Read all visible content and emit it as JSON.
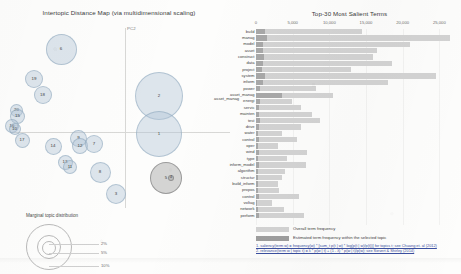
{
  "left_panel": {
    "title": "Intertopic Distance Map (via multidimensional scaling)",
    "axis_labels": {
      "x": "PC1",
      "y": "PC2"
    },
    "legend": {
      "title": "Marginal topic distribution",
      "ticks": [
        "2%",
        "5%",
        "10%"
      ]
    },
    "selected_term_callout": "asset_manag",
    "topics": [
      {
        "id": "6",
        "x": 53.0,
        "y": 23.0,
        "r": 15.5,
        "selected": false
      },
      {
        "id": "19",
        "x": 26.0,
        "y": 53.0,
        "r": 9.0,
        "selected": false
      },
      {
        "id": "18",
        "x": 34.5,
        "y": 69.0,
        "r": 9.0,
        "selected": false
      },
      {
        "id": "20",
        "x": 8.5,
        "y": 84.0,
        "r": 6.5,
        "selected": false
      },
      {
        "id": "15",
        "x": 9.5,
        "y": 90.0,
        "r": 7.5,
        "selected": false
      },
      {
        "id": "16",
        "x": 4.0,
        "y": 100.0,
        "r": 7.0,
        "selected": false
      },
      {
        "id": "10",
        "x": 6.5,
        "y": 103.0,
        "r": 6.0,
        "selected": false
      },
      {
        "id": "17",
        "x": 14.0,
        "y": 114.0,
        "r": 7.5,
        "selected": false
      },
      {
        "id": "14",
        "x": 45.0,
        "y": 120.0,
        "r": 8.5,
        "selected": false
      },
      {
        "id": "13",
        "x": 57.0,
        "y": 136.0,
        "r": 7.5,
        "selected": false
      },
      {
        "id": "11",
        "x": 62.0,
        "y": 141.0,
        "r": 7.0,
        "selected": false
      },
      {
        "id": "9",
        "x": 70.5,
        "y": 112.0,
        "r": 8.5,
        "selected": false
      },
      {
        "id": "12",
        "x": 72.0,
        "y": 120.0,
        "r": 8.0,
        "selected": false
      },
      {
        "id": "7",
        "x": 86.0,
        "y": 118.0,
        "r": 9.0,
        "selected": false
      },
      {
        "id": "8",
        "x": 92.0,
        "y": 146.0,
        "r": 10.5,
        "selected": false
      },
      {
        "id": "2",
        "x": 151.0,
        "y": 70.0,
        "r": 24.0,
        "selected": false
      },
      {
        "id": "1",
        "x": 151.0,
        "y": 108.0,
        "r": 23.0,
        "selected": false
      },
      {
        "id": "5",
        "x": 158.0,
        "y": 152.0,
        "r": 16.0,
        "selected": true
      },
      {
        "id": "4",
        "x": 163.0,
        "y": 152.0,
        "r": 3.2,
        "selected": true
      },
      {
        "id": "3",
        "x": 108.0,
        "y": 168.0,
        "r": 10.0,
        "selected": false
      }
    ]
  },
  "right_panel": {
    "legend": {
      "total_label": "Overall term frequency",
      "within_label": "Estimated term frequency within the selected topic"
    },
    "footnotes": [
      "1. saliency(term w) = frequency(w) * [sum_t p(t | w) * log(p(t | w)/p(t))] for topics t; see Chuang et. al (2012)",
      "2. relevance(term w | topic t) = λ * p(w | t) + (1 - λ) * p(w | t)/p(w); see Sievert & Shirley (2014)"
    ]
  },
  "chart_data": {
    "type": "bar",
    "title": "Top-30 Most Salient Terms",
    "xlabel": "",
    "ylabel": "",
    "xlim": [
      0,
      27000
    ],
    "xticks": [
      0,
      5000,
      10000,
      15000,
      20000,
      25000
    ],
    "xticklabels": [
      "0",
      "5,000",
      "10,000",
      "15,000",
      "20,000",
      "25,000"
    ],
    "grid": false,
    "legend_position": "bottom-left",
    "orientation": "horizontal",
    "categories": [
      "build",
      "manag",
      "model",
      "asset",
      "construct",
      "data",
      "project",
      "system",
      "inform",
      "power",
      "asset_manag",
      "energi",
      "servic",
      "mainten",
      "test",
      "drive",
      "water",
      "control",
      "oper",
      "wind",
      "type",
      "inform_model",
      "algorithm",
      "structur",
      "build_inform",
      "propos",
      "control",
      "voltag",
      "network",
      "perform"
    ],
    "series": [
      {
        "name": "Overall term frequency",
        "values": [
          14500,
          26500,
          21000,
          16500,
          16000,
          18500,
          13000,
          24500,
          18000,
          8200,
          10500,
          4900,
          6200,
          7600,
          8700,
          6200,
          3500,
          5600,
          3000,
          7000,
          4200,
          6800,
          4000,
          3600,
          3000,
          3100,
          5800,
          2200,
          3800,
          6500
        ]
      },
      {
        "name": "Estimated term frequency within the selected topic",
        "values": [
          1200,
          1500,
          1000,
          900,
          1100,
          1000,
          800,
          1200,
          950,
          600,
          3600,
          500,
          400,
          450,
          600,
          400,
          300,
          350,
          250,
          450,
          300,
          400,
          280,
          250,
          220,
          230,
          380,
          180,
          260,
          420
        ]
      }
    ]
  }
}
